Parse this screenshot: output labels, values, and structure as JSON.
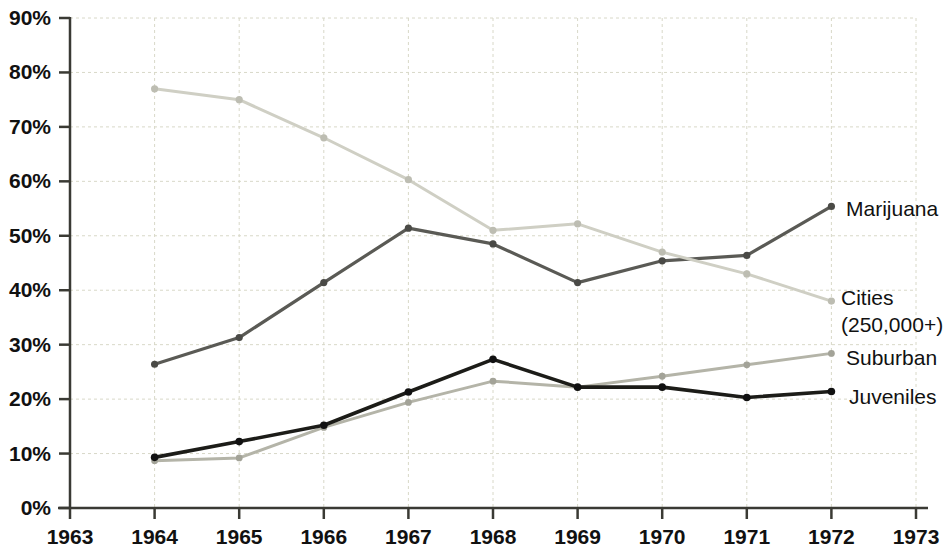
{
  "chart_data": {
    "type": "line",
    "title": "",
    "subtitle": "",
    "xlabel": "",
    "ylabel": "",
    "xlim": [
      1963,
      1973
    ],
    "ylim": [
      0,
      90
    ],
    "grid": true,
    "legend_position": "right-inline",
    "x_tick_labels": [
      "1963",
      "1964",
      "1965",
      "1966",
      "1967",
      "1968",
      "1969",
      "1970",
      "1971",
      "1972",
      "1973"
    ],
    "x_ticks": [
      1963,
      1964,
      1965,
      1966,
      1967,
      1968,
      1969,
      1970,
      1971,
      1972,
      1973
    ],
    "y_tick_labels": [
      "0%",
      "10%",
      "20%",
      "30%",
      "40%",
      "50%",
      "60%",
      "70%",
      "80%",
      "90%"
    ],
    "y_ticks": [
      0,
      10,
      20,
      30,
      40,
      50,
      60,
      70,
      80,
      90
    ],
    "x": [
      1964,
      1965,
      1966,
      1967,
      1968,
      1969,
      1970,
      1971,
      1972
    ],
    "series": [
      {
        "name": "Marijuana",
        "color": "#5a5a55",
        "marker_color": "#4a4a46",
        "values": [
          26.4,
          31.3,
          41.4,
          51.4,
          48.5,
          41.4,
          45.4,
          46.4,
          55.4
        ]
      },
      {
        "name": "Cities (250,000+)",
        "label_line1": "Cities",
        "label_line2": "(250,000+)",
        "color": "#cfcfc4",
        "marker_color": "#bdbdb2",
        "values": [
          77.0,
          75.0,
          68.0,
          60.3,
          51.0,
          52.2,
          47.0,
          43.0,
          38.0
        ]
      },
      {
        "name": "Suburban",
        "color": "#b4b4a8",
        "marker_color": "#a3a398",
        "values": [
          8.7,
          9.2,
          14.8,
          19.4,
          23.3,
          22.2,
          24.2,
          26.3,
          28.4
        ]
      },
      {
        "name": "Juveniles",
        "color": "#1c1c18",
        "marker_color": "#111111",
        "values": [
          9.3,
          12.2,
          15.2,
          21.3,
          27.3,
          22.2,
          22.2,
          20.3,
          21.4
        ]
      }
    ]
  },
  "labels": {
    "marijuana": "Marijuana",
    "cities_line1": "Cities",
    "cities_line2": "(250,000+)",
    "suburban": "Suburban",
    "juveniles": "Juveniles"
  }
}
